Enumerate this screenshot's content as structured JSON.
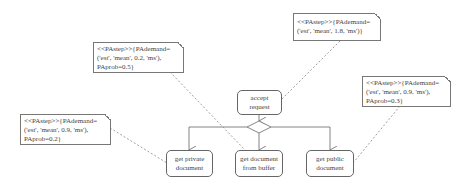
{
  "diagram": {
    "type": "UML activity diagram with performance annotations",
    "nodes": [
      {
        "id": "accept",
        "line1": "accept",
        "line2": "request"
      },
      {
        "id": "private",
        "line1": "get private",
        "line2": "document"
      },
      {
        "id": "buffer",
        "line1": "get document",
        "line2": "from buffer"
      },
      {
        "id": "public",
        "line1": "get public",
        "line2": "document"
      }
    ],
    "notes": [
      {
        "id": "note-accept",
        "line1": "<<PAstep>>{PAdemand=",
        "line2": "('est', 'mean', 1.8, 'ms')}",
        "line3": ""
      },
      {
        "id": "note-buffer",
        "line1": "<<PAstep>>{PAdemand=",
        "line2": "('est', 'mean', 0.2, 'ms'),",
        "line3": "PAprob=0.5}"
      },
      {
        "id": "note-public",
        "line1": "<<PAstep>>{PAdemand=",
        "line2": "('est', 'mean', 0.9, 'ms'),",
        "line3": "PAprob=0.3}"
      },
      {
        "id": "note-private",
        "line1": "<<PAstep>>{PAdemand=",
        "line2": "('est', 'mean', 0.9, 'ms'),",
        "line3": "PAprob=0.2}"
      }
    ],
    "colors": {
      "line": "#666666",
      "dashed": "#888888",
      "text": "#444444"
    }
  }
}
